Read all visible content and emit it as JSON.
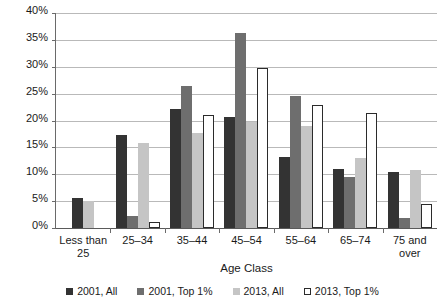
{
  "chart_data": {
    "type": "bar",
    "title": "",
    "xlabel": "Age Class",
    "ylabel": "",
    "ylim": [
      0,
      40
    ],
    "ytick_step": 5,
    "ytick_labels": [
      "0%",
      "5%",
      "10%",
      "15%",
      "20%",
      "25%",
      "30%",
      "35%",
      "40%"
    ],
    "grid": true,
    "legend_position": "bottom",
    "categories": [
      "Less than 25",
      "25–34",
      "35–44",
      "45–54",
      "55–64",
      "65–74",
      "75 and over"
    ],
    "series": [
      {
        "name": "2001, All",
        "color": "#333333",
        "values": [
          5.6,
          17.3,
          22.2,
          20.7,
          13.3,
          11.0,
          10.5
        ]
      },
      {
        "name": "2001, Top 1%",
        "color": "#6e6e6e",
        "values": [
          0.0,
          2.3,
          26.5,
          36.2,
          24.5,
          9.5,
          1.8
        ]
      },
      {
        "name": "2013, All",
        "color": "#c5c5c5",
        "values": [
          5.0,
          15.8,
          17.7,
          19.8,
          19.0,
          13.0,
          10.8
        ]
      },
      {
        "name": "2013, Top 1%",
        "color": "#ffffff",
        "values": [
          0.0,
          1.2,
          21.0,
          29.7,
          22.8,
          21.4,
          4.5
        ]
      }
    ]
  },
  "axis": {
    "x_title": "Age Class"
  }
}
